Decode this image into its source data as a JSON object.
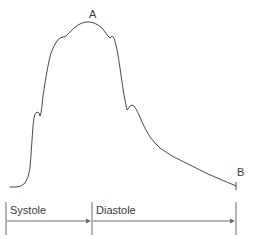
{
  "figure": {
    "line_color": "#4a4a4a",
    "background_color": "#ffffff",
    "text_color": "#3a3a3a"
  },
  "annotations": {
    "peak_label": "A",
    "end_label": "B"
  },
  "phases": [
    {
      "label": "Systole",
      "start_x": 6,
      "end_x": 92
    },
    {
      "label": "Diastole",
      "start_x": 92,
      "end_x": 236
    }
  ],
  "chart_data": {
    "type": "line",
    "xlabel": "",
    "ylabel": "",
    "grid": false,
    "legend": null,
    "axis_visible": false,
    "series": [
      {
        "name": "Arterial pressure",
        "description": "Single cardiac cycle arterial blood pressure trace with anacrotic upstroke, rounded systolic peak, dicrotic notch and diastolic runoff",
        "points_px": [
          [
            10,
            187
          ],
          [
            16,
            187
          ],
          [
            21,
            186
          ],
          [
            25,
            183
          ],
          [
            28,
            177
          ],
          [
            30,
            168
          ],
          [
            31,
            155
          ],
          [
            32,
            140
          ],
          [
            33,
            126
          ],
          [
            34,
            118
          ],
          [
            35,
            114
          ],
          [
            37,
            112
          ],
          [
            39,
            113
          ],
          [
            40,
            116
          ],
          [
            41,
            113
          ],
          [
            42,
            106
          ],
          [
            43,
            96
          ],
          [
            45,
            83
          ],
          [
            47,
            71
          ],
          [
            49,
            61
          ],
          [
            51,
            53
          ],
          [
            54,
            46
          ],
          [
            57,
            41
          ],
          [
            60,
            38
          ],
          [
            63,
            37
          ],
          [
            66,
            36
          ],
          [
            68,
            34
          ],
          [
            71,
            31
          ],
          [
            74,
            28
          ],
          [
            78,
            25
          ],
          [
            82,
            23
          ],
          [
            86,
            22
          ],
          [
            90,
            22
          ],
          [
            94,
            23
          ],
          [
            98,
            25
          ],
          [
            102,
            28
          ],
          [
            105,
            32
          ],
          [
            108,
            36
          ],
          [
            110,
            38
          ],
          [
            112,
            36
          ],
          [
            114,
            38
          ],
          [
            116,
            45
          ],
          [
            118,
            55
          ],
          [
            120,
            68
          ],
          [
            122,
            82
          ],
          [
            124,
            95
          ],
          [
            126,
            105
          ],
          [
            127,
            110
          ],
          [
            128,
            109
          ],
          [
            130,
            106
          ],
          [
            132,
            105
          ],
          [
            134,
            106
          ],
          [
            136,
            109
          ],
          [
            139,
            115
          ],
          [
            142,
            122
          ],
          [
            146,
            130
          ],
          [
            150,
            137
          ],
          [
            155,
            143
          ],
          [
            160,
            148
          ],
          [
            166,
            152
          ],
          [
            172,
            156
          ],
          [
            178,
            159
          ],
          [
            184,
            162
          ],
          [
            190,
            165
          ],
          [
            196,
            168
          ],
          [
            202,
            171
          ],
          [
            208,
            174
          ],
          [
            215,
            177
          ],
          [
            222,
            180
          ],
          [
            229,
            183
          ],
          [
            234,
            185
          ],
          [
            236,
            186
          ]
        ]
      }
    ],
    "markers": [
      {
        "label": "A",
        "description": "Systolic peak",
        "x_px": 90,
        "y_px": 22
      },
      {
        "label": "B",
        "description": "End diastolic pressure",
        "x_px": 236,
        "y_px": 186
      }
    ],
    "features": [
      {
        "name": "anacrotic-notch",
        "x_px": 39,
        "y_px": 113
      },
      {
        "name": "systolic-peak",
        "x_px": 88,
        "y_px": 22
      },
      {
        "name": "dicrotic-notch",
        "x_px": 128,
        "y_px": 109
      }
    ],
    "phase_axis": {
      "baseline_y_px": 221,
      "divider_top_y_px": 202,
      "divider_bottom_y_px": 235,
      "dividers_x_px": [
        6,
        92,
        236
      ]
    }
  }
}
